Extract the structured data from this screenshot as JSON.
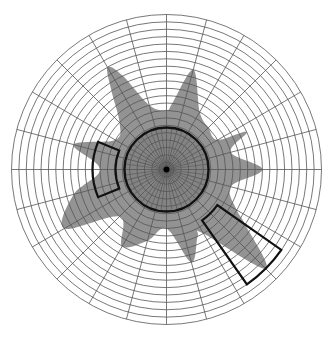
{
  "chart_data": {
    "type": "polar-area",
    "title": "",
    "grid": {
      "rings": 21,
      "spokes_outer_step_deg": 15,
      "spokes_inner_step_deg": 7.5,
      "inner_dense_rings": 5.7
    },
    "reference_circle_ring": 5.7,
    "coverage": {
      "angle_unit": "degrees counter-clockwise from east",
      "radius_unit": "rings",
      "angles": [
        0,
        15,
        25,
        30,
        45,
        60,
        75,
        85,
        90,
        105,
        115,
        120,
        125,
        135,
        150,
        165,
        180,
        195,
        210,
        225,
        240,
        255,
        270,
        285,
        295,
        300,
        315,
        325,
        330,
        345
      ],
      "radii": [
        13,
        9,
        12,
        8,
        8,
        9,
        14,
        9,
        8,
        9,
        14,
        16,
        13,
        9,
        8,
        13,
        9,
        13,
        16,
        9,
        12,
        10,
        8,
        13,
        10,
        10,
        19,
        13,
        11,
        9
      ],
      "color": "#808080"
    },
    "highlighted_sectors": [
      {
        "name": "left-sector",
        "angle_start": 158,
        "angle_end": 202,
        "ring_start": 6.9,
        "ring_end": 10.0
      },
      {
        "name": "lower-right-sector",
        "angle_start": 305,
        "angle_end": 325,
        "ring_start": 8.4,
        "ring_end": 19.0
      }
    ],
    "colors": {
      "grid": "#555555",
      "outline": "#111111",
      "fill": "#808080",
      "background": "#ffffff"
    }
  }
}
